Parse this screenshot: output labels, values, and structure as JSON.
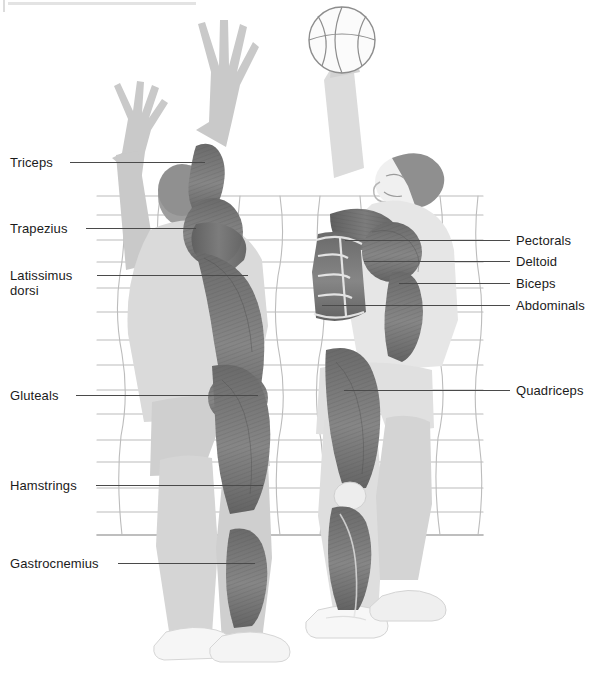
{
  "figure": {
    "background": "volleyball-style net grid"
  },
  "colors": {
    "muscle_dark": "#6f6f6f",
    "muscle_mid": "#8d8d8d",
    "body_light": "#e4e4e4",
    "body_shade": "#c9c9c9",
    "hair_dark": "#8a8a8a",
    "net_line": "#b9b9b9",
    "leader_line": "#4a4a4a",
    "text": "#1b1b1b",
    "shoe_white": "#f6f6f6",
    "top_rule": "#e3e3e3"
  },
  "ball": {
    "name": "basketball",
    "fill": "#fbfbfb",
    "stroke": "#8f8f8f",
    "cx": 342,
    "cy": 40,
    "r": 33
  },
  "labels_left": [
    {
      "id": "triceps",
      "text": "Triceps",
      "x": 10,
      "y": 155,
      "line_y": 162,
      "line_x1": 70,
      "line_x2": 205
    },
    {
      "id": "trapezius",
      "text": "Trapezius",
      "x": 10,
      "y": 221,
      "line_y": 228,
      "line_x1": 86,
      "line_x2": 196
    },
    {
      "id": "latissimus",
      "text": "Latissimus\ndorsi",
      "x": 10,
      "y": 268,
      "line_y": 275,
      "line_x1": 97,
      "line_x2": 248
    },
    {
      "id": "gluteals",
      "text": "Gluteals",
      "x": 10,
      "y": 388,
      "line_y": 395,
      "line_x1": 76,
      "line_x2": 258
    },
    {
      "id": "hamstrings",
      "text": "Hamstrings",
      "x": 10,
      "y": 478,
      "line_y": 485,
      "line_x1": 96,
      "line_x2": 263
    },
    {
      "id": "gastrocnemius",
      "text": "Gastrocnemius",
      "x": 10,
      "y": 556,
      "line_y": 563,
      "line_x1": 118,
      "line_x2": 255
    }
  ],
  "labels_right": [
    {
      "id": "pectorals",
      "text": "Pectorals",
      "x": 516,
      "y": 233,
      "line_y": 240,
      "line_x1": 345,
      "line_x2": 510
    },
    {
      "id": "deltoid",
      "text": "Deltoid",
      "x": 516,
      "y": 254,
      "line_y": 261,
      "line_x1": 364,
      "line_x2": 510
    },
    {
      "id": "biceps",
      "text": "Biceps",
      "x": 516,
      "y": 276,
      "line_y": 283,
      "line_x1": 399,
      "line_x2": 510
    },
    {
      "id": "abdominals",
      "text": "Abdominals",
      "x": 516,
      "y": 298,
      "line_y": 305,
      "line_x1": 322,
      "line_x2": 510
    },
    {
      "id": "quadriceps",
      "text": "Quadriceps",
      "x": 516,
      "y": 383,
      "line_y": 390,
      "line_x1": 344,
      "line_x2": 510
    }
  ],
  "net": {
    "x_left": 97,
    "x_right": 483,
    "y_top": 196,
    "y_bottom": 537,
    "horizontal_ys": [
      196,
      215,
      240,
      262,
      288,
      312,
      340,
      365,
      390,
      414,
      440,
      462,
      488,
      512,
      534
    ],
    "vertical_xs": [
      122,
      160,
      200,
      240,
      280,
      320,
      360,
      400,
      440,
      478
    ]
  }
}
